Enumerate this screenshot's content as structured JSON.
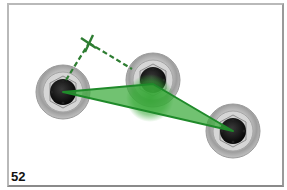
{
  "figure": {
    "number": "52"
  },
  "colors": {
    "triangle_fill": "#3aaa3a",
    "triangle_stroke": "#1f8a2a",
    "dashed_line": "#2e7d32",
    "wheel_rim": "#b5b5b5",
    "hub": "#111111",
    "frame_border": "#a8a8a8"
  },
  "elements": {
    "wheels": [
      {
        "name": "left-wheel",
        "cx": 63,
        "cy": 92
      },
      {
        "name": "middle-wheel",
        "cx": 153,
        "cy": 80
      },
      {
        "name": "right-wheel",
        "cx": 233,
        "cy": 131
      }
    ],
    "triangle_points": [
      [
        63,
        92
      ],
      [
        153,
        84
      ],
      [
        233,
        131
      ]
    ],
    "perpendicular_cross": {
      "x": 89,
      "y": 43
    }
  }
}
